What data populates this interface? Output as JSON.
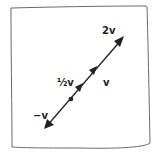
{
  "diagram": {
    "labels": {
      "two_v": "2v",
      "half_v": "½v",
      "v": "v",
      "neg_v": "−v"
    },
    "colors": {
      "ink": "#222222",
      "frame": "#555555",
      "background": "#ffffff"
    }
  }
}
